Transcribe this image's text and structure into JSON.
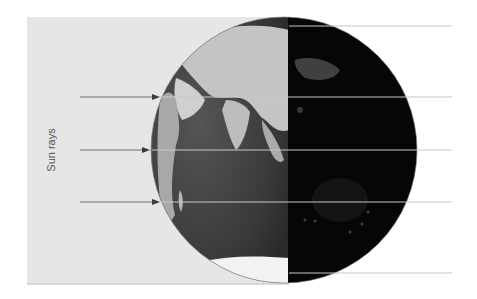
{
  "diagram": {
    "label": "Sun rays",
    "colors": {
      "background": "#ffffff",
      "sun_panel": "#e6e6e6",
      "ocean_day": "#3a3a3a",
      "land_day": "#bdbdbd",
      "night": "#060606",
      "ray_line": "#6e6e6e",
      "guide_line": "#c8c8c8"
    },
    "arrows": [
      {
        "y": 97
      },
      {
        "y": 150
      },
      {
        "y": 202
      }
    ],
    "guide_lines_y": [
      26,
      97,
      150,
      202,
      273
    ],
    "globe": {
      "cx": 284,
      "cy": 150,
      "r": 133,
      "terminator_x": 288
    }
  }
}
